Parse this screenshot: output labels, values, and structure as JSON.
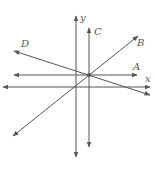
{
  "diagram": {
    "labels": {
      "y": "y",
      "x": "x",
      "A": "A",
      "B": "B",
      "C": "C",
      "D": "D"
    },
    "colors": {
      "line": "#555555",
      "background": "#ffffff"
    }
  }
}
